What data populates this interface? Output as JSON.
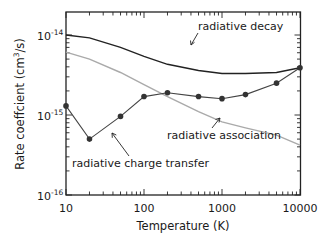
{
  "chart_data": {
    "type": "line",
    "title": "",
    "xlabel": "Temperature (K)",
    "ylabel": "Rate coeffcient (cm3/s)",
    "xscale": "log",
    "yscale": "log",
    "xlim": [
      10,
      10000
    ],
    "ylim": [
      1e-16,
      2e-14
    ],
    "x_ticks": [
      "10",
      "100",
      "1000",
      "10000"
    ],
    "y_ticks": [
      "10-16",
      "10-15",
      "10-14"
    ],
    "grid": false,
    "legend": "inline annotations with arrows",
    "series": [
      {
        "name": "radiative decay",
        "color": "#222222",
        "markers": false,
        "x": [
          10,
          20,
          50,
          100,
          200,
          500,
          1000,
          2000,
          5000,
          10000
        ],
        "y": [
          1e-14,
          9.2e-15,
          7e-15,
          5.4e-15,
          4.3e-15,
          3.6e-15,
          3.3e-15,
          3.3e-15,
          3.4e-15,
          3.9e-15
        ]
      },
      {
        "name": "radiative association",
        "color": "#aaaaaa",
        "markers": false,
        "x": [
          10,
          20,
          50,
          100,
          200,
          500,
          1000,
          2000,
          5000,
          10000
        ],
        "y": [
          6.1e-15,
          5e-15,
          3.4e-15,
          2.4e-15,
          1.7e-15,
          1.1e-15,
          8.2e-16,
          6.9e-16,
          5.6e-16,
          4.2e-16
        ]
      },
      {
        "name": "radiative charge transfer",
        "color": "#444444",
        "markers": true,
        "x": [
          10,
          20,
          50,
          100,
          200,
          500,
          1000,
          2000,
          5000,
          10000
        ],
        "y": [
          1.3e-15,
          5e-16,
          9.6e-16,
          1.7e-15,
          1.9e-15,
          1.7e-15,
          1.6e-15,
          1.8e-15,
          2.5e-15,
          3.9e-15
        ]
      }
    ],
    "annotations": [
      {
        "text": "radiative decay",
        "x": 450,
        "y": 1.1e-14
      },
      {
        "text": "radiative association",
        "x": 1200,
        "y": 4.5e-16
      },
      {
        "text": "radiative charge transfer",
        "x": 35,
        "y": 2.6e-16
      }
    ]
  },
  "labels": {
    "xlabel": "Temperature (K)",
    "ylabel": "Rate coeffcient (cm",
    "ylabel_sup": "3",
    "ylabel_end": "/s)",
    "xt10": "10",
    "xt100": "100",
    "xt1000": "1000",
    "xt10000": "10000",
    "yt_base": "10",
    "yt14": "-14",
    "yt15": "-15",
    "yt16": "-16",
    "ann_decay": "radiative decay",
    "ann_assoc": "radiative association",
    "ann_ct": "radiative charge transfer"
  }
}
